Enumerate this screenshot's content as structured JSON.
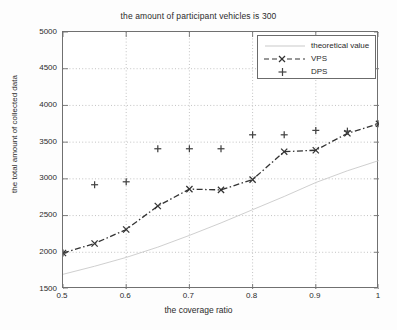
{
  "chart_data": {
    "type": "line",
    "title": "the amount of participant vehicles is 300",
    "xlabel": "the coverage ratio",
    "ylabel": "the total amount of collected data",
    "xlim": [
      0.5,
      1.0
    ],
    "ylim": [
      1500,
      5000
    ],
    "xticks": [
      "0.5",
      "0.6",
      "0.7",
      "0.8",
      "0.9",
      "1"
    ],
    "xtick_values": [
      0.5,
      0.6,
      0.7,
      0.8,
      0.9,
      1.0
    ],
    "yticks": [
      "1500",
      "2000",
      "2500",
      "3000",
      "3500",
      "4000",
      "4500",
      "5000"
    ],
    "ytick_values": [
      1500,
      2000,
      2500,
      3000,
      3500,
      4000,
      4500,
      5000
    ],
    "grid": true,
    "grid_style": "dotted",
    "legend_position": "top-right",
    "x": [
      0.5,
      0.55,
      0.6,
      0.65,
      0.7,
      0.75,
      0.8,
      0.85,
      0.9,
      0.95,
      1.0
    ],
    "series": [
      {
        "name": "theoretical value",
        "style": "solid-light",
        "color": "#c9c9c9",
        "marker": "none",
        "values": [
          1700,
          1810,
          1930,
          2070,
          2230,
          2400,
          2580,
          2760,
          2950,
          3110,
          3250
        ]
      },
      {
        "name": "VPS",
        "style": "dash-dot",
        "color": "#333333",
        "marker": "x",
        "values": [
          1990,
          2120,
          2310,
          2630,
          2860,
          2850,
          2990,
          3370,
          3390,
          3620,
          3750
        ]
      },
      {
        "name": "DPS",
        "style": "none",
        "color": "#444444",
        "marker": "plus",
        "values": [
          1990,
          2920,
          2960,
          3410,
          3410,
          3410,
          3600,
          3600,
          3660,
          3650,
          3750
        ]
      }
    ]
  },
  "legend": {
    "entries": [
      {
        "label": "theoretical value",
        "marker": "line-light"
      },
      {
        "label": "VPS",
        "marker": "dash-x-dash"
      },
      {
        "label": "DPS",
        "marker": "plus"
      }
    ]
  }
}
